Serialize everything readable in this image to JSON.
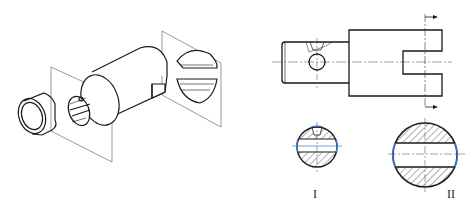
{
  "figure": {
    "type": "technical-drawing",
    "left_view": {
      "description": "Isometric exploded view of shaft with cross-section cutting planes"
    },
    "right_view": {
      "description": "Front view of stepped shaft with section line and two cross sections",
      "section_labels": [
        "I",
        "II"
      ]
    },
    "colors": {
      "line": "#1a1a1a",
      "thin_line": "#555555",
      "accent_blue": "#3a78c9",
      "hatch": "#333333",
      "background": "#ffffff"
    }
  }
}
